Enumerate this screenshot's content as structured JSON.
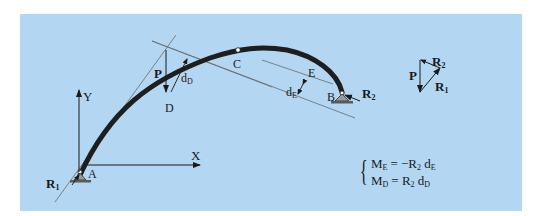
{
  "colors": {
    "background": "#b3d6f2",
    "beam": "#1e1e1e",
    "line": "#222222",
    "construction": "#6a6a6a"
  },
  "points": {
    "A": "A",
    "B": "B",
    "C": "C",
    "D": "D",
    "E": "E"
  },
  "axes": {
    "x": "X",
    "y": "Y"
  },
  "forces": {
    "P": "P",
    "R1": "R",
    "R1_sub": "1",
    "R2": "R",
    "R2_sub": "2"
  },
  "distances": {
    "dD": "d",
    "dD_sub": "D",
    "dE": "d",
    "dE_sub": "E"
  },
  "force_triangle": {
    "P": "P",
    "R1": "R",
    "R1_sub": "1",
    "R2": "R",
    "R2_sub": "2"
  },
  "equations": {
    "line1": {
      "lhs": "M",
      "lhs_sub": "E",
      "rhs": "= −R",
      "r_sub": "2",
      "d": " d",
      "d_sub": "E"
    },
    "line2": {
      "lhs": "M",
      "lhs_sub": "D",
      "rhs": "= R",
      "r_sub": "2",
      "d": " d",
      "d_sub": "D"
    }
  }
}
